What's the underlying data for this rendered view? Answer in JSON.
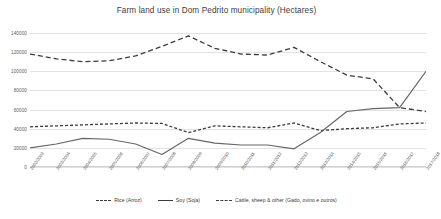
{
  "chart_data": {
    "type": "line",
    "title": "Farm land use in Dom Pedrito municipality (Hectares)",
    "xlabel": "",
    "ylabel": "",
    "ylim": [
      0,
      140000
    ],
    "ytick_step": 20000,
    "yticks": [
      "0",
      "20000",
      "40000",
      "60000",
      "80000",
      "100000",
      "120000",
      "140000"
    ],
    "grid": true,
    "legend_position": "bottom",
    "categories": [
      "2002/2003",
      "2003/2004",
      "2004/2005",
      "2005/2006",
      "2006/2007",
      "2007/2008",
      "2008/2009",
      "2009/2010",
      "2010/2011",
      "2011/2012",
      "2012/2013",
      "2013/2014",
      "2014/2015",
      "2015/2016",
      "2016/2017",
      "2017/2018"
    ],
    "series": [
      {
        "name": "Rice (Arroz)",
        "style": "dashed",
        "color": "#3c3c3c",
        "values": [
          42000,
          43000,
          44000,
          45000,
          46000,
          45500,
          36000,
          43000,
          42000,
          41000,
          46000,
          38000,
          40000,
          41000,
          45000,
          46000
        ]
      },
      {
        "name": "Soy (Soja)",
        "style": "solid",
        "color": "#666666",
        "values": [
          20000,
          24000,
          30000,
          29000,
          24000,
          13000,
          30000,
          25000,
          23000,
          23000,
          19000,
          36000,
          58000,
          61000,
          62000,
          100000
        ]
      },
      {
        "name": "Cattle, sheep & other (Gado, ovino e outros)",
        "style": "dashed",
        "color": "#3c3c3c",
        "values": [
          118000,
          113000,
          110000,
          111000,
          116000,
          126000,
          137000,
          124000,
          118000,
          117000,
          125000,
          110000,
          96000,
          92000,
          62000,
          58000
        ]
      }
    ]
  }
}
